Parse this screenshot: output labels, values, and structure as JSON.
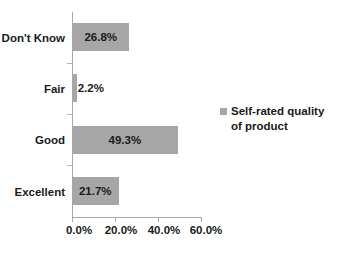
{
  "chart_data": {
    "type": "bar",
    "orientation": "horizontal",
    "title": "",
    "xlabel": "",
    "ylabel": "",
    "categories": [
      "Excellent",
      "Good",
      "Fair",
      "Don't Know"
    ],
    "values": [
      21.7,
      49.3,
      2.2,
      26.8
    ],
    "data_labels": [
      "21.7%",
      "49.3%",
      "2.2%",
      "26.8%"
    ],
    "series": [
      {
        "name": "Self-rated  quality of product",
        "values": [
          21.7,
          49.3,
          2.2,
          26.8
        ],
        "color": "#a6a6a6"
      }
    ],
    "xlim": [
      0,
      70
    ],
    "xticks": [
      0,
      20,
      40,
      60
    ],
    "xtick_labels": [
      "0.0%",
      "20.0%",
      "40.0%",
      "60.0%"
    ],
    "grid": false,
    "legend_position": "right"
  },
  "legend": {
    "line1": "Self-rated  quality",
    "line2": "of product",
    "marker_color": "#a6a6a6"
  },
  "axes": {
    "axis_color": "#a8a8a8",
    "tick_color": "#b5b5b5"
  }
}
